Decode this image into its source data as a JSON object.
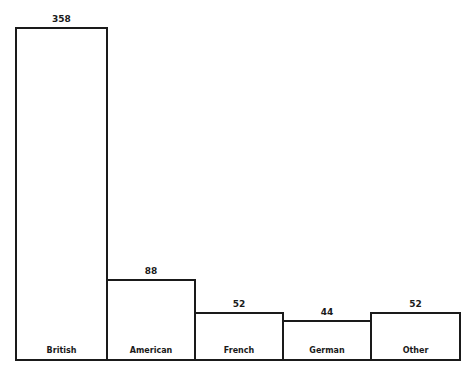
{
  "chart_data": {
    "type": "bar",
    "title": "",
    "xlabel": "",
    "ylabel": "",
    "categories": [
      "British",
      "American",
      "French",
      "German",
      "Other"
    ],
    "values": [
      358,
      88,
      52,
      44,
      52
    ],
    "ylim": [
      0,
      358
    ],
    "grid": false,
    "legend": null,
    "data_labels": true,
    "category_labels_inside_bars": true
  },
  "colors": {
    "bar_stroke": "#1a1a1a",
    "bar_fill": "#ffffff",
    "background": "#ffffff"
  }
}
